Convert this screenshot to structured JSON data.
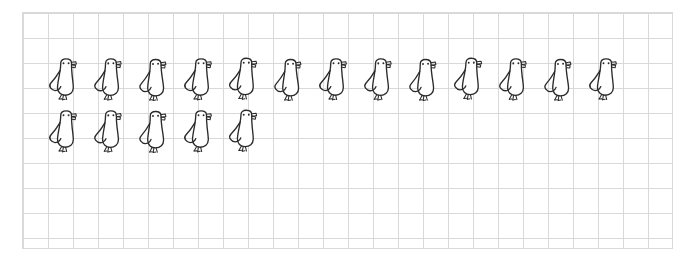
{
  "worksheet": {
    "title": "Bird counting grid",
    "description": "Hand-drawn doodle birds arranged on light graph paper",
    "background_color": "#ffffff",
    "ink_color": "#2b2b2b",
    "grid_color": "#d9d9d9"
  },
  "grid": {
    "cell_size_px": 25,
    "columns": 26,
    "rows": 9,
    "left_px": 22,
    "top_px": 12,
    "width_px": 650,
    "height_px": 236
  },
  "icon": {
    "name": "bird-doodle-icon",
    "label": "bird",
    "parts": [
      "tail-hook",
      "body",
      "eye-left",
      "eye-right",
      "beak",
      "feet"
    ]
  },
  "rows": [
    {
      "name": "bird-row-1",
      "count": 13,
      "count_label": "13",
      "birds": [
        {
          "label": "bird 1"
        },
        {
          "label": "bird 2"
        },
        {
          "label": "bird 3"
        },
        {
          "label": "bird 4"
        },
        {
          "label": "bird 5"
        },
        {
          "label": "bird 6"
        },
        {
          "label": "bird 7"
        },
        {
          "label": "bird 8"
        },
        {
          "label": "bird 9"
        },
        {
          "label": "bird 10"
        },
        {
          "label": "bird 11"
        },
        {
          "label": "bird 12"
        },
        {
          "label": "bird 13"
        }
      ]
    },
    {
      "name": "bird-row-2",
      "count": 5,
      "count_label": "5",
      "birds": [
        {
          "label": "bird 14"
        },
        {
          "label": "bird 15"
        },
        {
          "label": "bird 16"
        },
        {
          "label": "bird 17"
        },
        {
          "label": "bird 18"
        }
      ]
    }
  ],
  "totals": {
    "total_birds": 18,
    "total_label": "18"
  }
}
